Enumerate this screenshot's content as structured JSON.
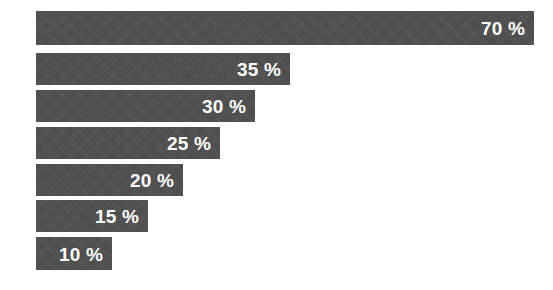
{
  "chart_data": {
    "type": "bar",
    "orientation": "horizontal",
    "title": "",
    "subtitle": "",
    "xlabel": "",
    "ylabel": "",
    "categories": [
      "",
      "",
      "",
      "",
      "",
      "",
      ""
    ],
    "values": [
      70,
      35,
      30,
      25,
      20,
      15,
      10
    ],
    "value_unit": "%",
    "data_labels": [
      "70 %",
      "35 %",
      "30 %",
      "25 %",
      "20 %",
      "15 %",
      "10 %"
    ],
    "xlim": [
      0,
      70
    ],
    "grid": false,
    "legend": false,
    "axis_visible": false,
    "tick_labels": [],
    "bars": [
      {
        "label": "70 %",
        "value": 70,
        "bar_right_px": 534,
        "top_px": 11,
        "height_px": 34
      },
      {
        "label": "35 %",
        "value": 35,
        "bar_right_px": 290,
        "top_px": 53,
        "height_px": 32
      },
      {
        "label": "30 %",
        "value": 30,
        "bar_right_px": 255,
        "top_px": 90,
        "height_px": 32
      },
      {
        "label": "25 %",
        "value": 25,
        "bar_right_px": 220,
        "top_px": 127,
        "height_px": 32
      },
      {
        "label": "20 %",
        "value": 20,
        "bar_right_px": 183,
        "top_px": 164,
        "height_px": 32
      },
      {
        "label": "15 %",
        "value": 15,
        "bar_right_px": 148,
        "top_px": 200,
        "height_px": 32
      },
      {
        "label": "10 %",
        "value": 10,
        "bar_right_px": 112,
        "top_px": 237,
        "height_px": 33
      }
    ]
  },
  "style": {
    "bar_color": "#4d4d4d",
    "label_color": "#ffffff",
    "background_color": "#ffffff",
    "bar_start_x_px": 36
  }
}
